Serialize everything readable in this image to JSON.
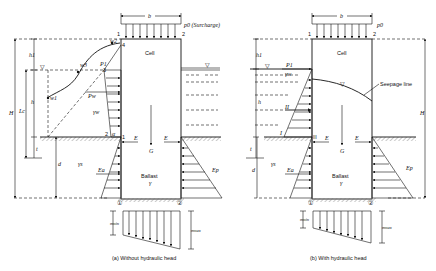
{
  "figure": {
    "panel_a": {
      "caption": "(a) Without hydraulic head",
      "surcharge_label": "p0 (Surcharge)",
      "width_label": "b",
      "cell_label": "Cell",
      "ballast_label": "Ballast",
      "ballast_gamma": "γ",
      "corner_1": "1",
      "corner_2": "2",
      "point_3": "3",
      "point_4": "4",
      "point_2_low": "2",
      "alpha": "α",
      "point_1_low": "1",
      "w1": "w1",
      "w2": "w2",
      "w3": "w3",
      "p1": "P1",
      "pw": "Pw",
      "gamma_w": "γw",
      "height_H": "H",
      "height_h1": "h1",
      "height_h": "h",
      "height_Lc": "Lc",
      "depth_t": "t",
      "depth_d": "d",
      "gamma_s": "γs",
      "E_left": "E",
      "E_right": "E",
      "G": "G",
      "Ea": "Ea",
      "Ep": "Ep",
      "wall_1": "①",
      "wall_2": "②",
      "sigma_min": "σmin",
      "sigma_max": "σmax",
      "water_symbol": "▽"
    },
    "panel_b": {
      "caption": "(b) With hydraulic head",
      "surcharge_label": "p0",
      "width_label": "b",
      "cell_label": "Cell",
      "ballast_label": "Ballast",
      "ballast_gamma": "γ",
      "corner_1": "1",
      "corner_2": "2",
      "p1": "P1",
      "gamma_w": "γw",
      "seepage_label": "Seepage line",
      "roman_I": "I",
      "roman_II": "II",
      "roman_III": "III",
      "height_H": "H",
      "height_h1": "h1",
      "height_h": "h",
      "depth_t": "t",
      "depth_d": "d",
      "gamma_s": "γs",
      "E_left": "E",
      "E_right": "E",
      "G": "G",
      "Ea": "Ea",
      "Ep": "Ep",
      "wall_1": "①",
      "wall_2": "②",
      "sigma_min": "σmin",
      "sigma_max": "σmax",
      "water_symbol": "▽"
    }
  },
  "colors": {
    "line": "#111111",
    "hatch": "#888888",
    "stipple": "#999999",
    "background": "#ffffff"
  }
}
